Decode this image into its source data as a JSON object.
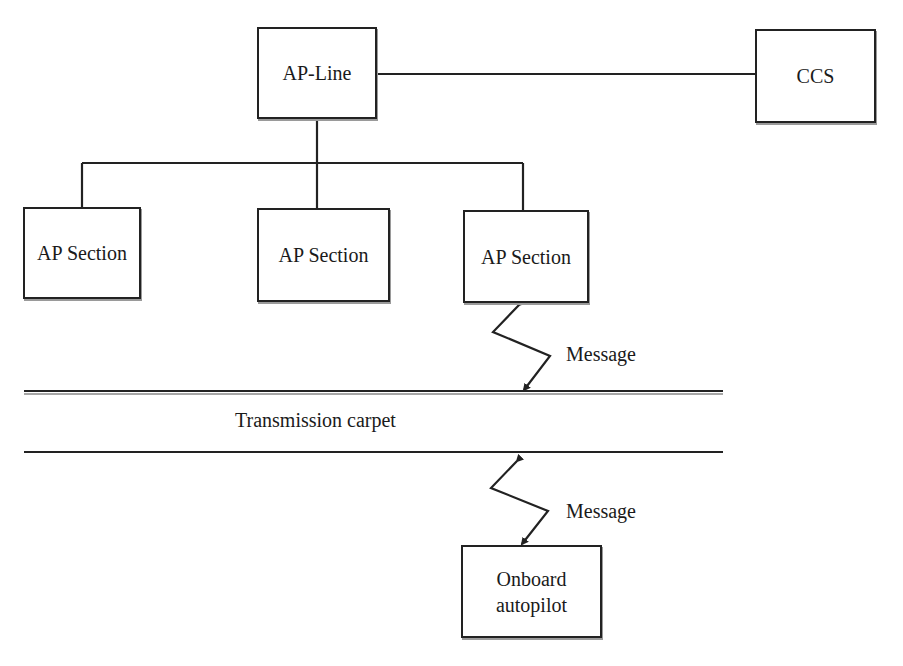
{
  "diagram": {
    "nodes": {
      "ap_line": {
        "label": "AP-Line"
      },
      "ccs": {
        "label": "CCS"
      },
      "ap_section_1": {
        "label": "AP Section"
      },
      "ap_section_2": {
        "label": "AP Section"
      },
      "ap_section_3": {
        "label": "AP Section"
      },
      "onboard_autopilot": {
        "line1": "Onboard",
        "line2": "autopilot"
      }
    },
    "labels": {
      "message_upper": "Message",
      "message_lower": "Message",
      "transmission_carpet": "Transmission carpet"
    },
    "edges": [
      {
        "from": "AP-Line",
        "to": "CCS",
        "type": "line"
      },
      {
        "from": "AP-Line",
        "to": "AP Section (left)",
        "type": "line"
      },
      {
        "from": "AP-Line",
        "to": "AP Section (middle)",
        "type": "line"
      },
      {
        "from": "AP-Line",
        "to": "AP Section (right)",
        "type": "line"
      },
      {
        "from": "AP Section (right)",
        "to": "Transmission carpet",
        "type": "wireless-bidirectional",
        "label": "Message"
      },
      {
        "from": "Transmission carpet",
        "to": "Onboard autopilot",
        "type": "wireless-bidirectional",
        "label": "Message"
      }
    ],
    "colors": {
      "stroke": "#222222",
      "background": "#ffffff",
      "text": "#1a1a1a"
    }
  }
}
